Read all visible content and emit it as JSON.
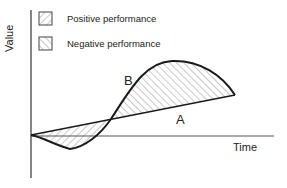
{
  "diagram": {
    "y_axis_label": "Value",
    "x_axis_label": "Time",
    "legend": [
      {
        "label": "Positive performance",
        "pattern": "hatch-backslash"
      },
      {
        "label": "Negative performance",
        "pattern": "hatch-slash"
      }
    ],
    "curves": [
      {
        "name": "A",
        "description": "straight line rising from origin"
      },
      {
        "name": "B",
        "description": "S-shaped curve dipping below then rising above A"
      }
    ],
    "colors": {
      "line": "#1a1a1a",
      "hatch": "#777777",
      "background": "#ffffff"
    }
  }
}
